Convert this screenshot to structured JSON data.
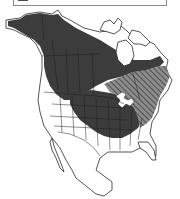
{
  "map": {
    "title": "North American range map",
    "region": "North America",
    "legend": {
      "visible": "partial (cut off at top edge)",
      "items": [
        {
          "label": "",
          "style": "solid dark fill",
          "color": "#3c3c3c"
        },
        {
          "label": "",
          "style": "diagonal hatch",
          "color": "#6a6a6a"
        }
      ]
    },
    "colors": {
      "background": "#ffffff",
      "land": "#ffffff",
      "border": "#2a2a2a",
      "range_solid": "#3c3c3c",
      "range_hatched_base": "#8c8c8c",
      "range_hatched_line": "#505050"
    },
    "ranges": [
      {
        "name": "solid-range",
        "description": "Alaska, western and central Canada, central United States"
      },
      {
        "name": "hatched-range",
        "description": "Eastern Canada and northeastern United States"
      }
    ]
  }
}
